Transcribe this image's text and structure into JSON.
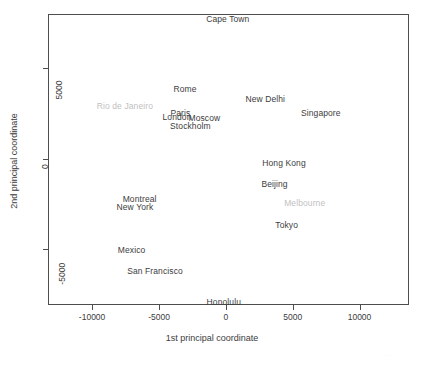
{
  "chart_data": {
    "type": "scatter",
    "title": "",
    "xlabel": "1st principal coordinate",
    "ylabel": "2nd principal coordinate",
    "xlim": [
      -13300,
      13700
    ],
    "ylim": [
      -8100,
      8000
    ],
    "xticks": [
      -10000,
      -5000,
      0,
      5000,
      10000
    ],
    "xticklabels": [
      "-10000",
      "-5000",
      "0",
      "5000",
      "10000"
    ],
    "yticks": [
      5000,
      0,
      -5000
    ],
    "yticklabels": [
      "5000",
      "0",
      "-5000"
    ],
    "grid": false,
    "legend": null,
    "marker": "text-label",
    "colors": {
      "label": "#3c3c3c",
      "label_faded": "#bfbfbf",
      "frame": "#4d4d4d",
      "background": "#ffffff"
    },
    "points": [
      {
        "label": "Cape Town",
        "x": 150,
        "y": 7750,
        "faded": false
      },
      {
        "label": "Rome",
        "x": -3050,
        "y": 3850,
        "faded": false
      },
      {
        "label": "New Delhi",
        "x": 2950,
        "y": 3300,
        "faded": false
      },
      {
        "label": "Rio de Janeiro",
        "x": -7550,
        "y": 2900,
        "faded": true
      },
      {
        "label": "Paris",
        "x": -3400,
        "y": 2550,
        "faded": false
      },
      {
        "label": "Singapore",
        "x": 7100,
        "y": 2500,
        "faded": false
      },
      {
        "label": "London",
        "x": -3650,
        "y": 2300,
        "faded": false
      },
      {
        "label": "Moscow",
        "x": -1600,
        "y": 2250,
        "faded": false
      },
      {
        "label": "Stockholm",
        "x": -2650,
        "y": 1800,
        "faded": false
      },
      {
        "label": "Hong Kong",
        "x": 4350,
        "y": -250,
        "faded": false
      },
      {
        "label": "Beijing",
        "x": 3650,
        "y": -1400,
        "faded": false
      },
      {
        "label": "Montreal",
        "x": -6450,
        "y": -2250,
        "faded": false
      },
      {
        "label": "Melbourne",
        "x": 5900,
        "y": -2450,
        "faded": true
      },
      {
        "label": "New York",
        "x": -6800,
        "y": -2650,
        "faded": false
      },
      {
        "label": "Tokyo",
        "x": 4550,
        "y": -3650,
        "faded": false
      },
      {
        "label": "Mexico",
        "x": -7050,
        "y": -5050,
        "faded": false
      },
      {
        "label": "San Francisco",
        "x": -5300,
        "y": -6200,
        "faded": false
      },
      {
        "label": "Honolulu",
        "x": -150,
        "y": -7950,
        "faded": false
      }
    ]
  }
}
